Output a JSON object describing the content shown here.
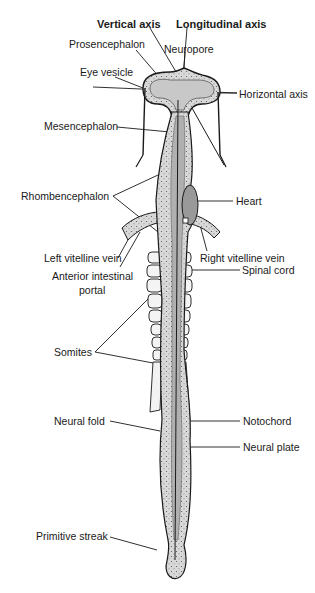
{
  "diagram": {
    "axes": {
      "vertical": "Vertical axis",
      "longitudinal": "Longitudinal axis",
      "horizontal": "Horizontal axis"
    },
    "labels": {
      "prosencephalon": "Prosencephalon",
      "neuropore": "Neuropore",
      "eye_vesicle": "Eye vesicle",
      "mesencephalon": "Mesencephalon",
      "rhombencephalon": "Rhombencephalon",
      "heart": "Heart",
      "left_vitelline_vein": "Left vitelline vein",
      "right_vitelline_vein": "Right vitelline vein",
      "anterior_intestinal_portal_1": "Anterior intestinal",
      "anterior_intestinal_portal_2": "portal",
      "spinal_cord": "Spinal cord",
      "somites": "Somites",
      "neural_fold": "Neural fold",
      "notochord": "Notochord",
      "neural_plate": "Neural plate",
      "primitive_streak": "Primitive streak"
    },
    "colors": {
      "line": "#1a1a1a",
      "tissue_fill": "#d4d4d4",
      "tissue_dark": "#a8a8a8",
      "somite_fill": "#f4f4f4"
    }
  }
}
